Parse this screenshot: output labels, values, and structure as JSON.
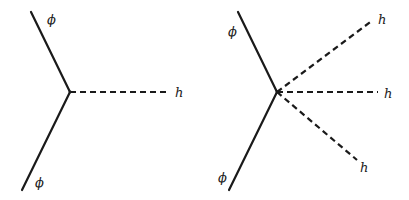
{
  "diagrams": [
    {
      "name": "three-point-vertex",
      "vertex": {
        "x": 70,
        "y": 92
      },
      "lines": [
        {
          "type": "solid",
          "particle": "scalar",
          "from": [
            31,
            12
          ],
          "to": [
            70,
            92
          ],
          "label": "ϕ",
          "label_pos": [
            47,
            24
          ]
        },
        {
          "type": "solid",
          "particle": "scalar",
          "from": [
            70,
            92
          ],
          "to": [
            22,
            190
          ],
          "label": "ϕ",
          "label_pos": [
            35,
            187
          ]
        },
        {
          "type": "dashed",
          "particle": "higgs",
          "from": [
            70,
            92
          ],
          "to": [
            168,
            92
          ],
          "label": "h",
          "label_pos": [
            175,
            97
          ]
        }
      ]
    },
    {
      "name": "five-point-vertex",
      "vertex": {
        "x": 277,
        "y": 92
      },
      "lines": [
        {
          "type": "solid",
          "particle": "scalar",
          "from": [
            238,
            12
          ],
          "to": [
            277,
            92
          ],
          "label": "ϕ",
          "label_pos": [
            228,
            36
          ]
        },
        {
          "type": "solid",
          "particle": "scalar",
          "from": [
            277,
            92
          ],
          "to": [
            229,
            190
          ],
          "label": "ϕ",
          "label_pos": [
            218,
            182
          ]
        },
        {
          "type": "dashed",
          "particle": "higgs",
          "from": [
            277,
            92
          ],
          "to": [
            373,
            20
          ],
          "label": "h",
          "label_pos": [
            378,
            24
          ]
        },
        {
          "type": "dashed",
          "particle": "higgs",
          "from": [
            277,
            92
          ],
          "to": [
            378,
            92
          ],
          "label": "h",
          "label_pos": [
            384,
            98
          ]
        },
        {
          "type": "dashed",
          "particle": "higgs",
          "from": [
            277,
            92
          ],
          "to": [
            357,
            160
          ],
          "label": "h",
          "label_pos": [
            360,
            172
          ]
        }
      ]
    }
  ],
  "labels": {
    "phi": "ϕ",
    "h": "h"
  }
}
